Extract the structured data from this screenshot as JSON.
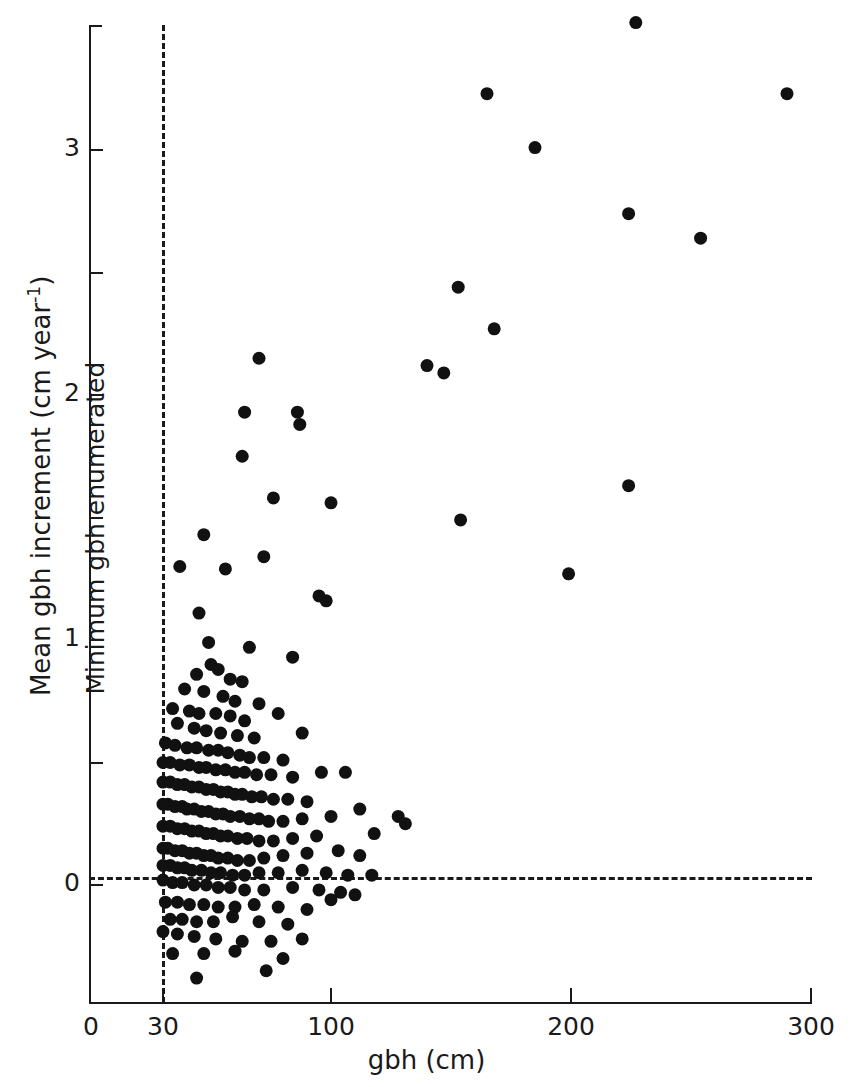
{
  "figure": {
    "background_color": "#ffffff",
    "ink_color": "#1a1a1a",
    "width": 853,
    "height": 1087
  },
  "axis_titles": {
    "x": "gbh (cm)",
    "y_prefix": "Mean gbh increment (cm year",
    "y_exponent": "-1",
    "y_suffix": ")"
  },
  "annotations": {
    "min_gbh_label": "Minimum gbh enumerated"
  },
  "chart_data": {
    "type": "scatter",
    "title": "",
    "xlabel": "gbh (cm)",
    "ylabel": "Mean gbh increment (cm year-1)",
    "xlim": [
      0,
      300
    ],
    "ylim": [
      -0.45,
      3.6
    ],
    "grid": false,
    "legend": null,
    "marker": {
      "shape": "circle",
      "color": "#111111",
      "size_px": 13
    },
    "x_ticks": [
      0,
      30,
      100,
      200,
      300
    ],
    "x_tick_labels": [
      "0",
      "30",
      "100",
      "200",
      "300"
    ],
    "y_ticks_major": [
      0,
      1,
      2,
      3
    ],
    "y_tick_labels": [
      "0",
      "1",
      "2",
      "3"
    ],
    "y_ticks_minor": [
      0.5,
      1.5,
      2.5
    ],
    "reference_lines": [
      {
        "name": "zero-increment-line",
        "orientation": "horizontal",
        "value": 0,
        "style": "dashed"
      },
      {
        "name": "minimum-gbh-enumerated-line",
        "orientation": "vertical",
        "value": 30,
        "style": "dashed",
        "label": "Minimum gbh enumerated"
      }
    ],
    "n_points": 206,
    "points": [
      [
        227,
        3.52
      ],
      [
        165,
        3.23
      ],
      [
        290,
        3.23
      ],
      [
        185,
        3.01
      ],
      [
        224,
        2.74
      ],
      [
        254,
        2.64
      ],
      [
        153,
        2.44
      ],
      [
        168,
        2.27
      ],
      [
        140,
        2.12
      ],
      [
        147,
        2.09
      ],
      [
        70,
        2.15
      ],
      [
        64,
        1.93
      ],
      [
        86,
        1.93
      ],
      [
        87,
        1.88
      ],
      [
        224,
        1.63
      ],
      [
        63,
        1.75
      ],
      [
        76,
        1.58
      ],
      [
        100,
        1.56
      ],
      [
        154,
        1.49
      ],
      [
        199,
        1.27
      ],
      [
        47,
        1.43
      ],
      [
        37,
        1.3
      ],
      [
        56,
        1.29
      ],
      [
        72,
        1.34
      ],
      [
        95,
        1.18
      ],
      [
        98,
        1.16
      ],
      [
        45,
        1.11
      ],
      [
        49,
        0.99
      ],
      [
        66,
        0.97
      ],
      [
        84,
        0.93
      ],
      [
        50,
        0.9
      ],
      [
        44,
        0.86
      ],
      [
        53,
        0.88
      ],
      [
        58,
        0.84
      ],
      [
        63,
        0.83
      ],
      [
        39,
        0.8
      ],
      [
        47,
        0.79
      ],
      [
        55,
        0.77
      ],
      [
        60,
        0.75
      ],
      [
        70,
        0.74
      ],
      [
        34,
        0.72
      ],
      [
        41,
        0.71
      ],
      [
        45,
        0.7
      ],
      [
        52,
        0.7
      ],
      [
        58,
        0.69
      ],
      [
        64,
        0.67
      ],
      [
        78,
        0.7
      ],
      [
        36,
        0.66
      ],
      [
        43,
        0.64
      ],
      [
        48,
        0.63
      ],
      [
        54,
        0.62
      ],
      [
        61,
        0.61
      ],
      [
        68,
        0.6
      ],
      [
        88,
        0.62
      ],
      [
        31,
        0.58
      ],
      [
        35,
        0.57
      ],
      [
        40,
        0.56
      ],
      [
        44,
        0.56
      ],
      [
        49,
        0.55
      ],
      [
        53,
        0.55
      ],
      [
        57,
        0.54
      ],
      [
        62,
        0.53
      ],
      [
        66,
        0.52
      ],
      [
        72,
        0.52
      ],
      [
        80,
        0.51
      ],
      [
        30,
        0.5
      ],
      [
        33,
        0.5
      ],
      [
        37,
        0.49
      ],
      [
        41,
        0.49
      ],
      [
        45,
        0.48
      ],
      [
        48,
        0.48
      ],
      [
        52,
        0.47
      ],
      [
        56,
        0.47
      ],
      [
        60,
        0.46
      ],
      [
        64,
        0.46
      ],
      [
        69,
        0.45
      ],
      [
        75,
        0.45
      ],
      [
        84,
        0.44
      ],
      [
        96,
        0.46
      ],
      [
        106,
        0.46
      ],
      [
        30,
        0.42
      ],
      [
        33,
        0.42
      ],
      [
        36,
        0.41
      ],
      [
        39,
        0.41
      ],
      [
        42,
        0.4
      ],
      [
        45,
        0.4
      ],
      [
        48,
        0.39
      ],
      [
        51,
        0.39
      ],
      [
        54,
        0.38
      ],
      [
        57,
        0.38
      ],
      [
        60,
        0.37
      ],
      [
        63,
        0.37
      ],
      [
        67,
        0.36
      ],
      [
        71,
        0.36
      ],
      [
        76,
        0.35
      ],
      [
        82,
        0.35
      ],
      [
        90,
        0.34
      ],
      [
        30,
        0.33
      ],
      [
        32,
        0.33
      ],
      [
        35,
        0.32
      ],
      [
        38,
        0.32
      ],
      [
        40,
        0.31
      ],
      [
        43,
        0.31
      ],
      [
        46,
        0.3
      ],
      [
        49,
        0.3
      ],
      [
        52,
        0.29
      ],
      [
        55,
        0.29
      ],
      [
        58,
        0.28
      ],
      [
        62,
        0.28
      ],
      [
        66,
        0.27
      ],
      [
        70,
        0.27
      ],
      [
        74,
        0.26
      ],
      [
        80,
        0.26
      ],
      [
        88,
        0.27
      ],
      [
        100,
        0.28
      ],
      [
        112,
        0.31
      ],
      [
        128,
        0.28
      ],
      [
        131,
        0.25
      ],
      [
        30,
        0.24
      ],
      [
        33,
        0.24
      ],
      [
        36,
        0.23
      ],
      [
        39,
        0.23
      ],
      [
        42,
        0.22
      ],
      [
        45,
        0.22
      ],
      [
        48,
        0.21
      ],
      [
        51,
        0.21
      ],
      [
        54,
        0.2
      ],
      [
        57,
        0.2
      ],
      [
        61,
        0.19
      ],
      [
        65,
        0.19
      ],
      [
        70,
        0.18
      ],
      [
        76,
        0.18
      ],
      [
        84,
        0.19
      ],
      [
        94,
        0.2
      ],
      [
        118,
        0.21
      ],
      [
        30,
        0.15
      ],
      [
        32,
        0.15
      ],
      [
        35,
        0.14
      ],
      [
        38,
        0.14
      ],
      [
        41,
        0.13
      ],
      [
        44,
        0.13
      ],
      [
        47,
        0.12
      ],
      [
        50,
        0.12
      ],
      [
        53,
        0.11
      ],
      [
        57,
        0.11
      ],
      [
        61,
        0.1
      ],
      [
        66,
        0.1
      ],
      [
        72,
        0.11
      ],
      [
        80,
        0.12
      ],
      [
        90,
        0.13
      ],
      [
        103,
        0.14
      ],
      [
        112,
        0.12
      ],
      [
        30,
        0.08
      ],
      [
        33,
        0.08
      ],
      [
        36,
        0.07
      ],
      [
        39,
        0.07
      ],
      [
        42,
        0.06
      ],
      [
        46,
        0.06
      ],
      [
        50,
        0.05
      ],
      [
        54,
        0.05
      ],
      [
        59,
        0.04
      ],
      [
        64,
        0.04
      ],
      [
        70,
        0.05
      ],
      [
        78,
        0.05
      ],
      [
        88,
        0.06
      ],
      [
        98,
        0.05
      ],
      [
        107,
        0.04
      ],
      [
        117,
        0.04
      ],
      [
        30,
        0.02
      ],
      [
        34,
        0.01
      ],
      [
        38,
        0.01
      ],
      [
        43,
        0.0
      ],
      [
        48,
        0.0
      ],
      [
        53,
        -0.01
      ],
      [
        58,
        -0.01
      ],
      [
        64,
        -0.02
      ],
      [
        72,
        -0.02
      ],
      [
        84,
        -0.01
      ],
      [
        95,
        -0.02
      ],
      [
        104,
        -0.03
      ],
      [
        110,
        -0.04
      ],
      [
        31,
        -0.07
      ],
      [
        36,
        -0.07
      ],
      [
        41,
        -0.08
      ],
      [
        47,
        -0.08
      ],
      [
        53,
        -0.09
      ],
      [
        60,
        -0.09
      ],
      [
        68,
        -0.08
      ],
      [
        78,
        -0.09
      ],
      [
        90,
        -0.1
      ],
      [
        100,
        -0.06
      ],
      [
        33,
        -0.14
      ],
      [
        38,
        -0.14
      ],
      [
        44,
        -0.15
      ],
      [
        51,
        -0.15
      ],
      [
        59,
        -0.13
      ],
      [
        70,
        -0.15
      ],
      [
        82,
        -0.16
      ],
      [
        30,
        -0.19
      ],
      [
        36,
        -0.2
      ],
      [
        43,
        -0.21
      ],
      [
        52,
        -0.22
      ],
      [
        63,
        -0.23
      ],
      [
        75,
        -0.23
      ],
      [
        88,
        -0.22
      ],
      [
        34,
        -0.28
      ],
      [
        47,
        -0.28
      ],
      [
        60,
        -0.27
      ],
      [
        80,
        -0.3
      ],
      [
        44,
        -0.38
      ],
      [
        73,
        -0.35
      ]
    ]
  }
}
